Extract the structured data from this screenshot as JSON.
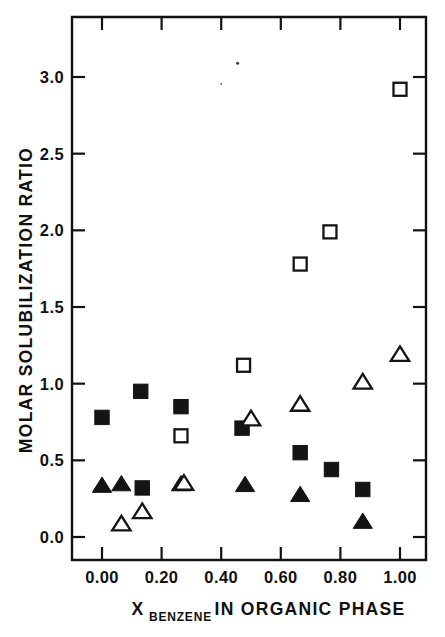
{
  "figure": {
    "background_color": "#ffffff",
    "ink_color": "#141414"
  },
  "chart_data": {
    "type": "scatter",
    "title": "",
    "xlabel_main": "IN ORGANIC PHASE",
    "xlabel_symbol": "X",
    "xlabel_subscript": "BENZENE",
    "ylabel": "MOLAR SOLUBILIZATION RATIO",
    "xlim": [
      -0.07,
      1.09
    ],
    "ylim": [
      -0.16,
      3.38
    ],
    "xticks": [
      0.0,
      0.2,
      0.4,
      0.6,
      0.8,
      1.0
    ],
    "xticklabels": [
      "0.00",
      "0.20",
      "0.40",
      "0.60",
      "0.80",
      "1.00"
    ],
    "yticks": [
      0.0,
      0.5,
      1.0,
      1.5,
      2.0,
      2.5,
      3.0
    ],
    "yticklabels": [
      "0.0",
      "0.5",
      "1.0",
      "1.5",
      "2.0",
      "2.5",
      "3.0"
    ],
    "grid": false,
    "legend": "none",
    "frame": "box",
    "tick_direction": "in",
    "series": [
      {
        "name": "filled-square",
        "marker": "square",
        "fill": "solid",
        "color": "#141414",
        "points": [
          {
            "x": 0.0,
            "y": 0.78
          },
          {
            "x": 0.13,
            "y": 0.95
          },
          {
            "x": 0.135,
            "y": 0.32
          },
          {
            "x": 0.265,
            "y": 0.85
          },
          {
            "x": 0.47,
            "y": 0.71
          },
          {
            "x": 0.665,
            "y": 0.55
          },
          {
            "x": 0.77,
            "y": 0.44
          },
          {
            "x": 0.875,
            "y": 0.31
          }
        ]
      },
      {
        "name": "open-square",
        "marker": "square",
        "fill": "open",
        "color": "#141414",
        "points": [
          {
            "x": 0.265,
            "y": 0.66
          },
          {
            "x": 0.475,
            "y": 1.12
          },
          {
            "x": 0.665,
            "y": 1.78
          },
          {
            "x": 0.765,
            "y": 1.99
          },
          {
            "x": 1.0,
            "y": 2.92
          }
        ]
      },
      {
        "name": "filled-triangle",
        "marker": "triangle",
        "fill": "solid",
        "color": "#141414",
        "points": [
          {
            "x": 0.0,
            "y": 0.335
          },
          {
            "x": 0.065,
            "y": 0.345
          },
          {
            "x": 0.265,
            "y": 0.345
          },
          {
            "x": 0.48,
            "y": 0.34
          },
          {
            "x": 0.665,
            "y": 0.275
          },
          {
            "x": 0.875,
            "y": 0.1
          }
        ]
      },
      {
        "name": "open-triangle",
        "marker": "triangle",
        "fill": "open",
        "color": "#141414",
        "points": [
          {
            "x": 0.065,
            "y": 0.085
          },
          {
            "x": 0.135,
            "y": 0.165
          },
          {
            "x": 0.275,
            "y": 0.35
          },
          {
            "x": 0.5,
            "y": 0.77
          },
          {
            "x": 0.665,
            "y": 0.865
          },
          {
            "x": 0.875,
            "y": 1.01
          },
          {
            "x": 1.0,
            "y": 1.19
          }
        ]
      }
    ],
    "artifacts": [
      {
        "name": "speck",
        "x": 0.455,
        "y": 3.09,
        "size": 3
      },
      {
        "name": "speck",
        "x": 0.4,
        "y": 2.955,
        "size": 1.6
      }
    ]
  }
}
